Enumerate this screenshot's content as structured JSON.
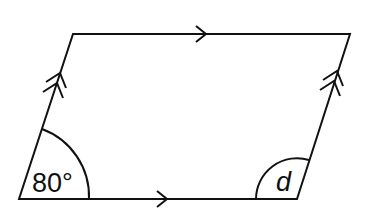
{
  "diagram": {
    "type": "parallelogram",
    "vertices": {
      "top_left": [
        73,
        34
      ],
      "top_right": [
        350,
        34
      ],
      "bottom_right": [
        297,
        199
      ],
      "bottom_left": [
        19,
        199
      ]
    },
    "stroke_color": "#111111",
    "background": "#ffffff",
    "angles": [
      {
        "vertex": "bottom_left",
        "label": "80°",
        "value_degrees": 80
      },
      {
        "vertex": "bottom_right",
        "label": "d",
        "value_degrees": null
      }
    ],
    "parallel_markers": [
      {
        "side": "top",
        "arrows": 1
      },
      {
        "side": "bottom",
        "arrows": 1
      },
      {
        "side": "left",
        "arrows": 2
      },
      {
        "side": "right",
        "arrows": 2
      }
    ]
  },
  "labels": {
    "angle_bottom_left": "80°",
    "angle_bottom_right": "d"
  }
}
